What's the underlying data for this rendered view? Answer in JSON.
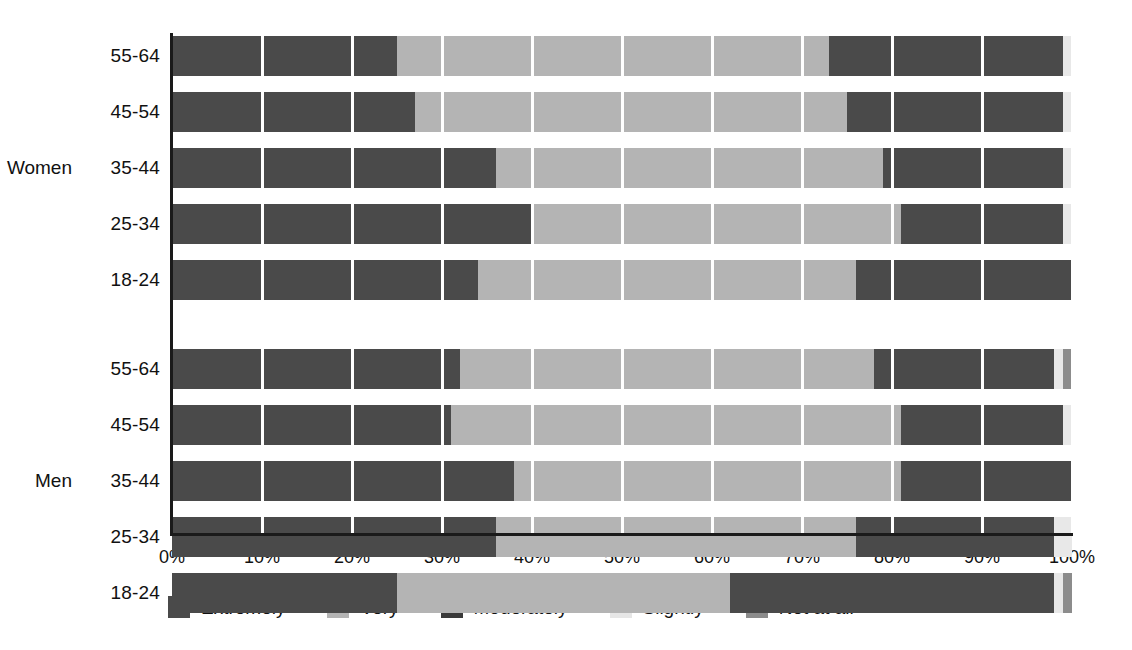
{
  "chart_data": {
    "type": "bar",
    "subtype": "stacked-horizontal-100-percent",
    "title": "",
    "subtitle": "",
    "xlabel": "",
    "ylabel": "",
    "xlim": [
      0,
      100
    ],
    "xtick_labels": [
      "0%",
      "10%",
      "20%",
      "30%",
      "40%",
      "50%",
      "60%",
      "70%",
      "80%",
      "90%",
      "100%"
    ],
    "xtick_values": [
      0,
      10,
      20,
      30,
      40,
      50,
      60,
      70,
      80,
      90,
      100
    ],
    "grid": "vertical-white-gridlines",
    "legend_position": "bottom-left",
    "series": [
      {
        "name": "Extremely",
        "color": "#4a4a4a"
      },
      {
        "name": "Very",
        "color": "#b4b4b4"
      },
      {
        "name": "Moderately",
        "color": "#4a4a4a"
      },
      {
        "name": "Slightly",
        "color": "#e8e8e8"
      },
      {
        "name": "Not at all",
        "color": "#8c8c8c"
      }
    ],
    "groups": [
      {
        "name": "Women",
        "categories": [
          "55-64",
          "45-54",
          "35-44",
          "25-34",
          "18-24"
        ],
        "rows": [
          {
            "category": "55-64",
            "values": [
              25,
              48,
              26,
              1,
              0
            ]
          },
          {
            "category": "45-54",
            "values": [
              27,
              48,
              24,
              1,
              0
            ]
          },
          {
            "category": "35-44",
            "values": [
              36,
              43,
              20,
              1,
              0
            ]
          },
          {
            "category": "25-34",
            "values": [
              40,
              41,
              18,
              1,
              0
            ]
          },
          {
            "category": "18-24",
            "values": [
              34,
              42,
              24,
              0,
              0
            ]
          }
        ]
      },
      {
        "name": "Men",
        "categories": [
          "55-64",
          "45-54",
          "35-44",
          "25-34",
          "18-24"
        ],
        "rows": [
          {
            "category": "55-64",
            "values": [
              32,
              46,
              20,
              1,
              1
            ]
          },
          {
            "category": "45-54",
            "values": [
              31,
              50,
              18,
              1,
              0
            ]
          },
          {
            "category": "35-44",
            "values": [
              38,
              43,
              19,
              0,
              0
            ]
          },
          {
            "category": "25-34",
            "values": [
              36,
              40,
              22,
              2,
              0
            ]
          },
          {
            "category": "18-24",
            "values": [
              25,
              37,
              36,
              1,
              1
            ]
          }
        ]
      }
    ]
  },
  "legend": {
    "items": [
      {
        "label": "Extremely",
        "color": "#4a4a4a"
      },
      {
        "label": "Very",
        "color": "#b4b4b4"
      },
      {
        "label": "Moderately",
        "color": "#3a3a3a"
      },
      {
        "label": "Slightly",
        "color": "#e6e6e6"
      },
      {
        "label": "Not at all",
        "color": "#8c8c8c"
      }
    ]
  },
  "colors": {
    "axis": "#1a1a1a",
    "text": "#111111",
    "background": "#ffffff",
    "gridline": "#ffffff"
  }
}
